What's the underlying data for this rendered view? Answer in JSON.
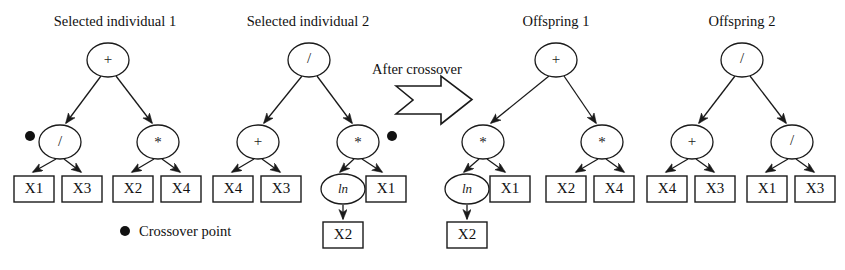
{
  "diagram": {
    "type": "genetic-programming-crossover",
    "width": 845,
    "height": 270,
    "background": "#ffffff",
    "stroke_color": "#1a1a1a",
    "text_color": "#111111"
  },
  "titles": {
    "parent1": "Selected individual 1",
    "parent2": "Selected individual 2",
    "offspring1": "Offspring 1",
    "offspring2": "Offspring 2"
  },
  "caption": {
    "after_crossover": "After crossover"
  },
  "legend": {
    "marker": "crossover-point-dot",
    "label": "Crossover point"
  },
  "trees": [
    {
      "name": "parent1",
      "title": "Selected individual 1",
      "root": {
        "label": "+",
        "kind": "operator",
        "children": [
          {
            "label": "/",
            "kind": "operator",
            "crossover_point": true,
            "children": [
              {
                "label": "X1",
                "kind": "terminal"
              },
              {
                "label": "X3",
                "kind": "terminal"
              }
            ]
          },
          {
            "label": "*",
            "kind": "operator",
            "children": [
              {
                "label": "X2",
                "kind": "terminal"
              },
              {
                "label": "X4",
                "kind": "terminal"
              }
            ]
          }
        ]
      }
    },
    {
      "name": "parent2",
      "title": "Selected individual 2",
      "root": {
        "label": "/",
        "kind": "operator",
        "children": [
          {
            "label": "+",
            "kind": "operator",
            "children": [
              {
                "label": "X4",
                "kind": "terminal"
              },
              {
                "label": "X3",
                "kind": "terminal"
              }
            ]
          },
          {
            "label": "*",
            "kind": "operator",
            "crossover_point": true,
            "children": [
              {
                "label": "ln",
                "kind": "function",
                "children": [
                  {
                    "label": "X2",
                    "kind": "terminal"
                  }
                ]
              },
              {
                "label": "X1",
                "kind": "terminal"
              }
            ]
          }
        ]
      }
    },
    {
      "name": "offspring1",
      "title": "Offspring 1",
      "root": {
        "label": "+",
        "kind": "operator",
        "children": [
          {
            "label": "*",
            "kind": "operator",
            "children": [
              {
                "label": "ln",
                "kind": "function",
                "children": [
                  {
                    "label": "X2",
                    "kind": "terminal"
                  }
                ]
              },
              {
                "label": "X1",
                "kind": "terminal"
              }
            ]
          },
          {
            "label": "*",
            "kind": "operator",
            "children": [
              {
                "label": "X2",
                "kind": "terminal"
              },
              {
                "label": "X4",
                "kind": "terminal"
              }
            ]
          }
        ]
      }
    },
    {
      "name": "offspring2",
      "title": "Offspring 2",
      "root": {
        "label": "/",
        "kind": "operator",
        "children": [
          {
            "label": "+",
            "kind": "operator",
            "children": [
              {
                "label": "X4",
                "kind": "terminal"
              },
              {
                "label": "X3",
                "kind": "terminal"
              }
            ]
          },
          {
            "label": "/",
            "kind": "operator",
            "children": [
              {
                "label": "X1",
                "kind": "terminal"
              },
              {
                "label": "X3",
                "kind": "terminal"
              }
            ]
          }
        ]
      }
    }
  ],
  "labels": {
    "p1_root": "+",
    "p1_l": "/",
    "p1_r": "*",
    "p1_ll": "X1",
    "p1_lr": "X3",
    "p1_rl": "X2",
    "p1_rr": "X4",
    "p2_root": "/",
    "p2_l": "+",
    "p2_r": "*",
    "p2_ll": "X4",
    "p2_lr": "X3",
    "p2_rl": "ln",
    "p2_rll": "X2",
    "p2_rr": "X1",
    "o1_root": "+",
    "o1_l": "*",
    "o1_r": "*",
    "o1_ll": "ln",
    "o1_lll": "X2",
    "o1_lr": "X1",
    "o1_rl": "X2",
    "o1_rr": "X4",
    "o2_root": "/",
    "o2_l": "+",
    "o2_r": "/",
    "o2_ll": "X4",
    "o2_lr": "X3",
    "o2_rl": "X1",
    "o2_rr": "X3"
  }
}
